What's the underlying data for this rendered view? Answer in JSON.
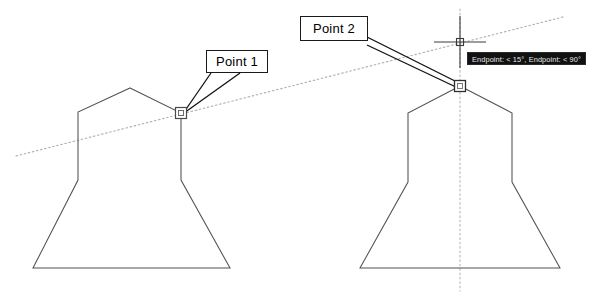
{
  "drawing": {
    "title": "CAD object snap point selection",
    "background_color": "#ffffff",
    "geometry_color": "#4a4a4a",
    "construction_line_color": "#b0a6a6",
    "annotation_color": "#1a1a1a"
  },
  "callouts": [
    {
      "id": "point-1",
      "label": "Point 1",
      "x": 206,
      "y": 50,
      "width": 62,
      "height": 23
    },
    {
      "id": "point-2",
      "label": "Point 2",
      "x": 300,
      "y": 16,
      "width": 68,
      "height": 25
    }
  ],
  "tooltip": {
    "text": "Endpoint: < 15°, Endpoint: < 90°",
    "x": 467,
    "y": 52,
    "background_color": "#111111",
    "text_color": "#e8e8e8"
  },
  "snap_markers": [
    {
      "id": "snap-marker-left",
      "x": 181,
      "y": 113,
      "size": 11,
      "type": "endpoint-square"
    },
    {
      "id": "snap-marker-right",
      "x": 460,
      "y": 86,
      "size": 11,
      "type": "endpoint-square"
    }
  ],
  "crosshair": {
    "x": 460,
    "y": 42,
    "arm_length": 26,
    "pickbox_size": 7
  },
  "shapes": [
    {
      "id": "profile-left",
      "name": "left-lamp-profile",
      "points": "130,88 78,112 78,180 33,268 230,268 181,180 181,113"
    },
    {
      "id": "profile-right",
      "name": "right-lamp-profile",
      "points": "460,86 408,113 408,182 360,268 560,268 512,182 512,113"
    }
  ],
  "construction_lines": [
    {
      "id": "angled-guide",
      "name": "angled-construction-line",
      "x1": 16,
      "y1": 156,
      "x2": 563,
      "y2": 17,
      "style": "dotted"
    },
    {
      "id": "vertical-guide",
      "name": "vertical-construction-line",
      "x1": 460,
      "y1": 9,
      "x2": 460,
      "y2": 291,
      "style": "dotted"
    }
  ],
  "leader_lines": [
    {
      "id": "leader-1a",
      "x1": 212,
      "y1": 74,
      "x2": 182,
      "y2": 114
    },
    {
      "id": "leader-1b",
      "x1": 240,
      "y1": 74,
      "x2": 183,
      "y2": 114
    },
    {
      "id": "leader-2a",
      "x1": 367,
      "y1": 38,
      "x2": 460,
      "y2": 85
    },
    {
      "id": "leader-2b",
      "x1": 367,
      "y1": 45,
      "x2": 460,
      "y2": 88
    }
  ]
}
